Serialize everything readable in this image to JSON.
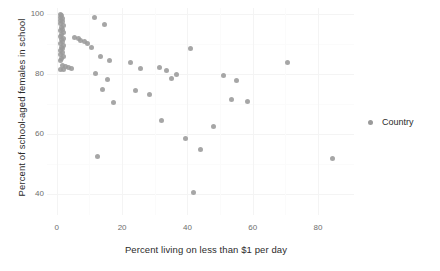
{
  "chart_data": {
    "type": "scatter",
    "title": "",
    "xlabel": "Percent living on less than $1 per day",
    "ylabel": "Percent of school-aged females in school",
    "xlim": [
      -3,
      91
    ],
    "ylim": [
      33,
      102
    ],
    "xticks": [
      0,
      20,
      40,
      60,
      80
    ],
    "xtick_labels": [
      "0",
      "20",
      "40",
      "60",
      "80"
    ],
    "yticks": [
      40,
      60,
      80,
      100
    ],
    "ytick_labels": [
      "40",
      "60",
      "80",
      "100"
    ],
    "grid": true,
    "legend": {
      "position": "right",
      "entries": [
        {
          "label": "Country",
          "color": "#9a9a9a",
          "marker": "circle"
        }
      ]
    },
    "series": [
      {
        "name": "Country",
        "color": "#9a9a9a",
        "points": [
          [
            1.0,
            100.0
          ],
          [
            1.4,
            99.5
          ],
          [
            1.0,
            99.0
          ],
          [
            1.8,
            98.6
          ],
          [
            1.2,
            98.0
          ],
          [
            1.6,
            97.4
          ],
          [
            1.0,
            96.8
          ],
          [
            2.0,
            96.2
          ],
          [
            1.3,
            95.6
          ],
          [
            1.7,
            95.0
          ],
          [
            1.1,
            94.4
          ],
          [
            2.2,
            93.8
          ],
          [
            1.5,
            93.2
          ],
          [
            1.0,
            92.6
          ],
          [
            1.9,
            92.0
          ],
          [
            1.3,
            91.4
          ],
          [
            1.6,
            90.8
          ],
          [
            1.1,
            90.2
          ],
          [
            2.1,
            89.6
          ],
          [
            1.4,
            89.0
          ],
          [
            1.8,
            88.4
          ],
          [
            1.2,
            87.8
          ],
          [
            1.6,
            87.2
          ],
          [
            1.0,
            86.6
          ],
          [
            2.0,
            86.0
          ],
          [
            1.5,
            85.2
          ],
          [
            1.2,
            84.4
          ],
          [
            5.5,
            92.3
          ],
          [
            6.5,
            92.0
          ],
          [
            7.3,
            91.2
          ],
          [
            8.5,
            90.8
          ],
          [
            9.3,
            90.2
          ],
          [
            1.6,
            83.0
          ],
          [
            2.6,
            82.6
          ],
          [
            3.6,
            82.2
          ],
          [
            4.6,
            82.0
          ],
          [
            1.2,
            81.6
          ],
          [
            2.2,
            81.4
          ],
          [
            11.5,
            99.0
          ],
          [
            14.5,
            96.5
          ],
          [
            10.5,
            88.8
          ],
          [
            13.5,
            86.0
          ],
          [
            16.0,
            84.6
          ],
          [
            12.0,
            80.2
          ],
          [
            15.5,
            78.2
          ],
          [
            14.0,
            75.0
          ],
          [
            17.5,
            70.5
          ],
          [
            12.5,
            52.5
          ],
          [
            22.5,
            84.0
          ],
          [
            25.5,
            82.0
          ],
          [
            24.0,
            74.5
          ],
          [
            28.5,
            73.2
          ],
          [
            31.5,
            82.2
          ],
          [
            33.5,
            81.2
          ],
          [
            36.5,
            80.0
          ],
          [
            35.0,
            78.5
          ],
          [
            32.0,
            64.5
          ],
          [
            41.0,
            88.5
          ],
          [
            39.5,
            58.5
          ],
          [
            42.0,
            40.5
          ],
          [
            44.0,
            55.0
          ],
          [
            51.0,
            79.5
          ],
          [
            55.0,
            78.0
          ],
          [
            53.5,
            71.5
          ],
          [
            58.5,
            71.0
          ],
          [
            48.0,
            62.5
          ],
          [
            70.5,
            84.0
          ],
          [
            84.5,
            52.0
          ]
        ]
      }
    ]
  },
  "legend": {
    "title": "",
    "label": "Country"
  },
  "axes": {
    "x_title": "Percent living on less than $1 per day",
    "y_title": "Percent of school-aged females in school"
  }
}
